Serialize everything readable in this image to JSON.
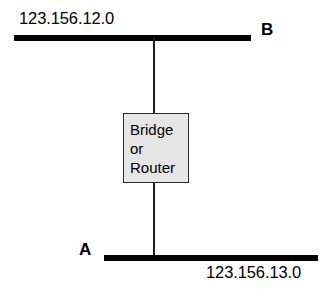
{
  "diagram": {
    "type": "network-topology",
    "segments": [
      {
        "id": "top",
        "station": "B",
        "address": "123.156.12.0"
      },
      {
        "id": "bottom",
        "station": "A",
        "address": "123.156.13.0"
      }
    ],
    "device": {
      "label": "Bridge\nor\nRouter",
      "fill_color": "#e6e6e6",
      "border_color": "#2b2b2b"
    },
    "line_color": "#000000",
    "background_color": "#ffffff"
  }
}
